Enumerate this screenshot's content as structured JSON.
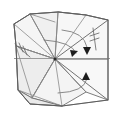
{
  "figure": {
    "type": "origami-fold-diagram",
    "canvas": {
      "width": 124,
      "height": 117
    },
    "background_color": "#ffffff",
    "line_color": "#6e6e6e",
    "fill_color": "#f3f3f3",
    "arrow_color": "#1c1c1c",
    "center_vertex": {
      "x": 55,
      "y": 59,
      "label": "center-vertex"
    }
  },
  "panels": [
    {
      "name": "upper-left-face",
      "fill": "#f5f5f5",
      "points": "14,24 30,14 55,22 55,59 16,46"
    },
    {
      "name": "upper-middle-face",
      "fill": "#f0f0f0",
      "points": "30,14 58,12 86,15 55,59"
    },
    {
      "name": "upper-right-face",
      "fill": "#f7f7f7",
      "points": "58,12 86,15 108,20 108,59 55,59"
    },
    {
      "name": "lower-left-face",
      "fill": "#ededed",
      "points": "16,46 55,59 32,98 18,90"
    },
    {
      "name": "lower-middle-face",
      "fill": "#f4f4f4",
      "points": "32,98 55,59 86,92 62,106"
    },
    {
      "name": "lower-right-face",
      "fill": "#f8f8f8",
      "points": "55,59 108,59 108,100 86,92"
    },
    {
      "name": "lower-left-flap",
      "fill": "#eaeaea",
      "points": "18,90 32,98 62,106 30,104"
    }
  ],
  "creases": [
    {
      "name": "crease-radial-upper-left",
      "d": "M55,59 L14,24"
    },
    {
      "name": "crease-radial-up-left",
      "d": "M55,59 L30,14"
    },
    {
      "name": "crease-radial-up",
      "d": "M55,59 L58,12"
    },
    {
      "name": "crease-radial-up-right",
      "d": "M55,59 L86,15"
    },
    {
      "name": "crease-radial-upper-right",
      "d": "M55,59 L108,20"
    },
    {
      "name": "crease-radial-right",
      "d": "M55,59 L108,59"
    },
    {
      "name": "crease-radial-lower-right",
      "d": "M55,59 L108,100"
    },
    {
      "name": "crease-radial-down-right",
      "d": "M55,59 L86,92"
    },
    {
      "name": "crease-radial-down",
      "d": "M55,59 L62,106"
    },
    {
      "name": "crease-radial-down-left",
      "d": "M55,59 L32,98"
    },
    {
      "name": "crease-radial-left",
      "d": "M55,59 L16,46"
    },
    {
      "name": "crease-horizon-left",
      "d": "M14,58 L55,59"
    },
    {
      "name": "crease-edge-left-upper",
      "d": "M14,24 L16,46"
    },
    {
      "name": "crease-edge-left-lower",
      "d": "M16,46 L18,90"
    },
    {
      "name": "crease-bottom-left",
      "d": "M18,90 L30,104"
    },
    {
      "name": "crease-bottom-mid",
      "d": "M30,104 L62,106"
    },
    {
      "name": "crease-bottom-right",
      "d": "M62,106 L108,100"
    },
    {
      "name": "crease-top-left",
      "d": "M14,24 L30,14"
    },
    {
      "name": "crease-top-mid",
      "d": "M30,14 L58,12"
    },
    {
      "name": "crease-top-right",
      "d": "M58,12 L86,15 L108,20"
    }
  ],
  "outline": {
    "name": "paper-outline",
    "d": "M14,24 L30,14 L58,12 L86,15 L108,20 L108,100 L62,106 L30,104 L18,90 L16,46 Z"
  },
  "fold_arrows": [
    {
      "name": "fold-arrow-upper-right",
      "kind": "valley-fold",
      "arc": "M62,30 Q84,32 87,47",
      "head": {
        "x": 87,
        "y": 52,
        "angle": 100
      },
      "direction": "downward"
    },
    {
      "name": "fold-arrow-center-right",
      "kind": "valley-fold",
      "arc": "M44,40 Q72,42 76,53",
      "head": {
        "x": 75,
        "y": 55,
        "angle": 40
      },
      "direction": "down-right"
    },
    {
      "name": "fold-arrow-lower-right",
      "kind": "mountain-fold",
      "arc": "M58,93 Q84,92 87,79",
      "head": {
        "x": 87,
        "y": 74,
        "angle": -80
      },
      "direction": "upward"
    }
  ],
  "tick_marks": [
    {
      "name": "tick-mark-right",
      "stem": "M93,28 L96,50",
      "crossings": [
        "M90,36 L99,33",
        "M90,41 L99,38"
      ]
    },
    {
      "name": "tick-mark-left",
      "stem": "M15,44 L30,57",
      "crossings": [
        "M19,43 L23,52",
        "M23,46 L27,55"
      ]
    }
  ],
  "annotations": {
    "center_dot_label": "center-vertex-dot",
    "horizontal_band_label": "horizontal-crease-band"
  }
}
